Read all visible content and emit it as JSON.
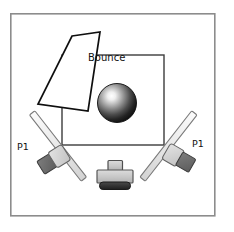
{
  "diagram": {
    "type": "photography-lighting-diagram",
    "canvas": {
      "width": 234,
      "height": 232,
      "background": "#ffffff"
    },
    "colors": {
      "frame_stroke": "#8a8a8a",
      "room_stroke": "#3d3d3d",
      "outline": "#1a1a1a",
      "panel_fill": "#ffffff",
      "strip_fill": "#e9e9e9",
      "strip_stroke": "#7a7a7a",
      "head_front": "#d2d2d2",
      "head_back": "#6e6e6e",
      "camera_body": "#c9c9c9",
      "camera_base": "#2e2e2e",
      "sphere_highlight": "#ffffff",
      "sphere_edge": "#121212",
      "text": "#111111"
    },
    "labels": [
      {
        "name": "bounce-label",
        "text": "Bounce",
        "x": 88,
        "y": 57
      },
      {
        "name": "p1-left-label",
        "text": "P1",
        "x": 17,
        "y": 146
      },
      {
        "name": "p1-right-label",
        "text": "P1",
        "x": 192,
        "y": 143
      }
    ],
    "elements": {
      "outer_frame": {
        "name": "outer-frame",
        "x": 10,
        "y": 13,
        "width": 205,
        "height": 203,
        "stroke": "#8a8a8a",
        "stroke_width": 1.6,
        "fill": "#ffffff"
      },
      "room_rect": {
        "name": "room-rectangle",
        "x": 62,
        "y": 55,
        "width": 102,
        "height": 90,
        "stroke": "#3d3d3d",
        "stroke_width": 1.4,
        "fill": "none"
      },
      "bounce_card": {
        "name": "bounce-card-panel",
        "points": "72,36 100,32 88,111 38,104",
        "stroke": "#0f0f0f",
        "stroke_width": 1.6,
        "fill": "#ffffff"
      },
      "sphere": {
        "name": "subject-sphere",
        "cx": 117,
        "cy": 103,
        "r": 19,
        "highlight_cx": 112,
        "highlight_cy": 97
      },
      "strip_left": {
        "name": "softbox-strip-left",
        "x1": 33,
        "y1": 114,
        "x2": 84,
        "y2": 179,
        "thickness": 6.5
      },
      "strip_right": {
        "name": "softbox-strip-right",
        "x1": 194,
        "y1": 113,
        "x2": 143,
        "y2": 179,
        "thickness": 6.5
      },
      "head_left": {
        "name": "light-head-left",
        "front": "47,151 62,145 69,158 53,165",
        "back": "40,160 53,154 60,167 46,174",
        "rotation": -30
      },
      "head_right": {
        "name": "light-head-right",
        "front": "166,150 180,145 186,157 172,163",
        "back": "179,147 193,153 187,166 173,160",
        "rotation": 28
      },
      "camera_bottom": {
        "name": "camera-bottom-center",
        "lens_x": 108,
        "lens_y": 161,
        "lens_w": 14,
        "lens_h": 10,
        "body_x": 97,
        "body_y": 170,
        "body_w": 36,
        "body_h": 13,
        "base_x": 99,
        "base_y": 182,
        "base_w": 32,
        "base_h": 7
      }
    }
  }
}
